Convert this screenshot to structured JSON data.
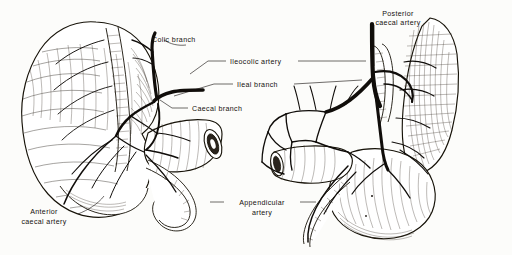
{
  "figure": {
    "background_color": "#fcfcfa",
    "ink_color": "#18140f",
    "style": "black-and-white line engraving",
    "views": [
      {
        "name": "left-view",
        "description": "Anterior view of caecum, ascending colon, terminal ileum and vermiform appendix"
      },
      {
        "name": "right-view",
        "description": "Posterior view of caecum with vascular arcades and appendix"
      }
    ]
  },
  "labels": [
    {
      "id": "colic-branch",
      "text": "Colic branch",
      "lines": [
        "Colic branch"
      ],
      "x": 152,
      "y": 42,
      "anchor": "start"
    },
    {
      "id": "ileocolic-artery",
      "text": "Ileocolic artery",
      "lines": [
        "Ileocolic artery"
      ],
      "x": 230,
      "y": 64,
      "anchor": "start"
    },
    {
      "id": "ileal-branch",
      "text": "Ileal branch",
      "lines": [
        "Ileal branch"
      ],
      "x": 237,
      "y": 87,
      "anchor": "start"
    },
    {
      "id": "caecal-branch",
      "text": "Caecal branch",
      "lines": [
        "Caecal branch"
      ],
      "x": 192,
      "y": 111,
      "anchor": "start"
    },
    {
      "id": "posterior-caecal-artery",
      "text": "Posterior caecal artery",
      "lines": [
        "Posterior",
        "caecal artery"
      ],
      "x": 398,
      "y": 16,
      "anchor": "middle"
    },
    {
      "id": "anterior-caecal-artery",
      "text": "Anterior caecal artery",
      "lines": [
        "Anterior",
        "caecal artery"
      ],
      "x": 44,
      "y": 222,
      "anchor": "middle"
    },
    {
      "id": "appendicular-artery",
      "text": "Appendicular artery",
      "lines": [
        "Appendicular",
        "artery"
      ],
      "x": 262,
      "y": 205,
      "anchor": "middle"
    }
  ],
  "anatomy": {
    "structures": [
      "ascending colon",
      "caecum",
      "terminal ileum",
      "vermiform appendix",
      "ileocolic artery",
      "colic branch",
      "ileal branch",
      "caecal branch",
      "anterior caecal artery",
      "posterior caecal artery",
      "appendicular artery",
      "vascular arcades"
    ]
  }
}
